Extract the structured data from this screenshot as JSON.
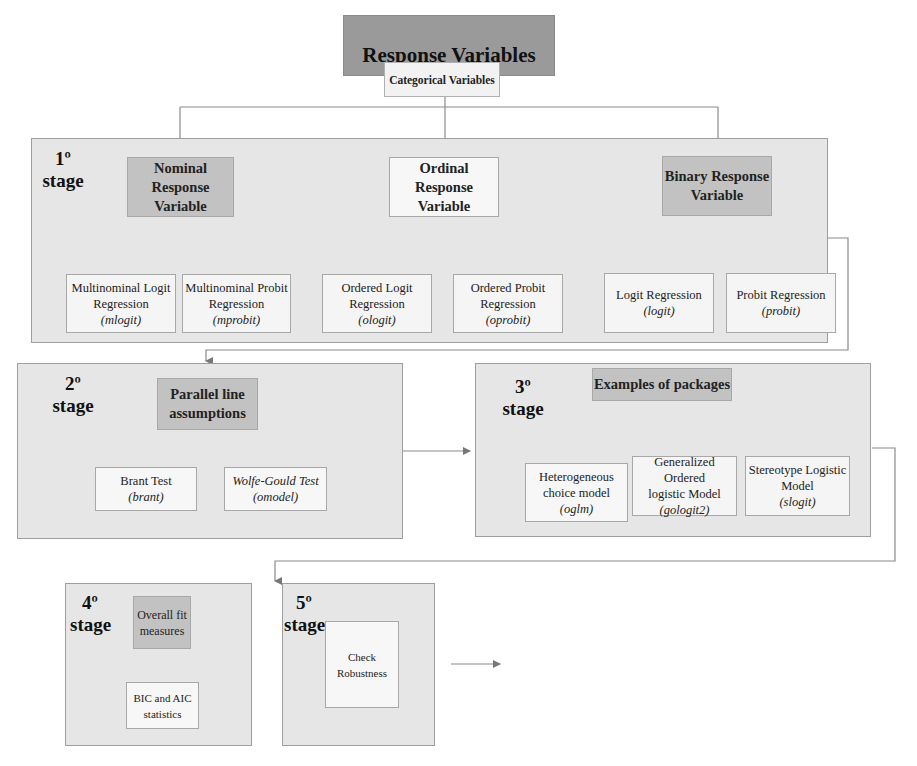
{
  "title": {
    "main": "Response Variables",
    "sub": "Categorical Variables"
  },
  "stage1": {
    "label_num": "1º",
    "label_word": "stage",
    "categories": [
      {
        "label": "Nominal Response Variable",
        "line1": "Nominal",
        "line2": "Response",
        "line3": "Variable"
      },
      {
        "label": "Ordinal Response Variable",
        "line1": "Ordinal",
        "line2": "Response",
        "line3": "Variable"
      },
      {
        "label": "Binary Response Variable",
        "line1": "Binary Response",
        "line2": "Variable"
      }
    ],
    "models": [
      {
        "line1": "Multinominal Logit",
        "line2": "Regression",
        "cmd": "(mlogit)"
      },
      {
        "line1": "Multinominal Probit",
        "line2": "Regression",
        "cmd": "(mprobit)"
      },
      {
        "line1": "Ordered Logit",
        "line2": "Regression",
        "cmd": "(ologit)"
      },
      {
        "line1": "Ordered Probit",
        "line2": "Regression",
        "cmd": "(oprobit)"
      },
      {
        "line1": "Logit Regression",
        "cmd": "(logit)"
      },
      {
        "line1": "Probit Regression",
        "cmd": "(probit)"
      }
    ]
  },
  "stage2": {
    "label_num": "2º",
    "label_word": "stage",
    "header": {
      "line1": "Parallel line",
      "line2": "assumptions"
    },
    "tests": [
      {
        "name": "Brant Test",
        "cmd": "(brant)"
      },
      {
        "name": "Wolfe-Gould Test",
        "cmd": "(omodel)"
      }
    ]
  },
  "stage3": {
    "label_num": "3º",
    "label_word": "stage",
    "header": "Examples of packages",
    "packages": [
      {
        "line1": "Heterogeneous",
        "line2": "choice model",
        "cmd": "(oglm)"
      },
      {
        "line1": "Generalized Ordered",
        "line2": "logistic Model",
        "cmd": "(gologit2)"
      },
      {
        "line1": "Stereotype Logistic",
        "line2": "Model",
        "cmd": "(slogit)"
      }
    ]
  },
  "stage4": {
    "label_num": "4º",
    "label_word": "stage",
    "header": {
      "line1": "Overall fit",
      "line2": "measures"
    },
    "item": "BIC and AIC statistics"
  },
  "stage5": {
    "label_num": "5º",
    "label_word": "stage",
    "item": "Check Robustness"
  }
}
